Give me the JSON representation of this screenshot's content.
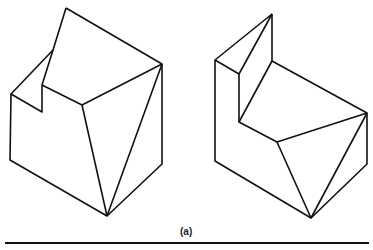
{
  "figure": {
    "caption": "(a)",
    "stroke_color": "#111111",
    "stroke_width": 1.6,
    "left_object": {
      "name": "notched-block-left",
      "polylines": [
        [
          [
            66,
            8
          ],
          [
            162,
            64
          ],
          [
            162,
            164
          ],
          [
            107,
            216
          ],
          [
            10,
            160
          ],
          [
            11,
            94
          ],
          [
            42,
            112
          ],
          [
            42,
            85
          ],
          [
            53,
            50
          ],
          [
            66,
            8
          ]
        ],
        [
          [
            11,
            94
          ],
          [
            53,
            50
          ]
        ],
        [
          [
            42,
            85
          ],
          [
            82,
            105
          ],
          [
            162,
            64
          ]
        ],
        [
          [
            82,
            105
          ],
          [
            107,
            216
          ]
        ],
        [
          [
            162,
            64
          ],
          [
            107,
            216
          ]
        ]
      ]
    },
    "right_object": {
      "name": "stepped-block-right",
      "polylines": [
        [
          [
            272,
            14
          ],
          [
            215,
            60
          ],
          [
            215,
            161
          ],
          [
            311,
            218
          ],
          [
            367,
            164
          ],
          [
            367,
            113
          ],
          [
            272,
            61
          ],
          [
            272,
            14
          ]
        ],
        [
          [
            215,
            60
          ],
          [
            239,
            74
          ],
          [
            239,
            122
          ],
          [
            277,
            142
          ],
          [
            367,
            113
          ]
        ],
        [
          [
            272,
            14
          ],
          [
            239,
            74
          ]
        ],
        [
          [
            272,
            61
          ],
          [
            239,
            122
          ]
        ],
        [
          [
            277,
            142
          ],
          [
            311,
            218
          ]
        ],
        [
          [
            367,
            113
          ],
          [
            311,
            218
          ]
        ]
      ]
    }
  }
}
